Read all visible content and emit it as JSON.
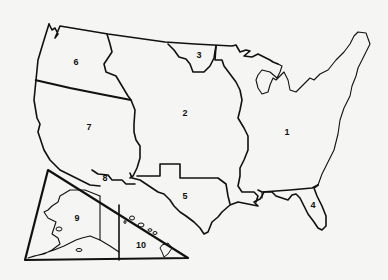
{
  "map": {
    "title": "",
    "regions": [
      {
        "id": "1",
        "label": "1",
        "x": 287,
        "y": 132
      },
      {
        "id": "2",
        "label": "2",
        "x": 185,
        "y": 113
      },
      {
        "id": "3",
        "label": "3",
        "x": 199,
        "y": 55
      },
      {
        "id": "4",
        "label": "4",
        "x": 313,
        "y": 205
      },
      {
        "id": "5",
        "label": "5",
        "x": 185,
        "y": 196
      },
      {
        "id": "6",
        "label": "6",
        "x": 76,
        "y": 62
      },
      {
        "id": "7",
        "label": "7",
        "x": 89,
        "y": 127
      },
      {
        "id": "8",
        "label": "8",
        "x": 105,
        "y": 178
      },
      {
        "id": "9",
        "label": "9",
        "x": 77,
        "y": 218
      },
      {
        "id": "10",
        "label": "10",
        "x": 141,
        "y": 245
      }
    ],
    "insets": [
      "Alaska",
      "Hawaii"
    ],
    "colors": {
      "line": "#111111",
      "background": "#f5f5f3"
    }
  }
}
